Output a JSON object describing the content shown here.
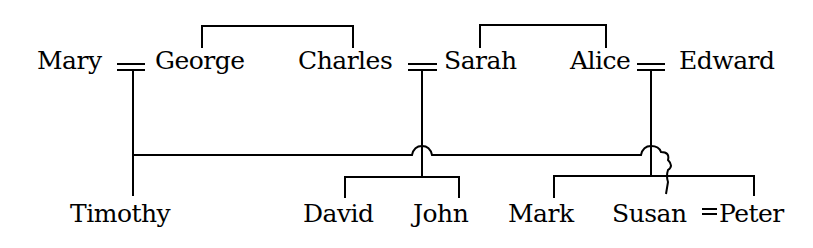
{
  "diagram": {
    "type": "family-tree",
    "ink_color": "#000000",
    "background": "#ffffff",
    "people": {
      "mary": "Mary",
      "george": "George",
      "charles": "Charles",
      "sarah": "Sarah",
      "alice": "Alice",
      "edward": "Edward",
      "timothy": "Timothy",
      "david": "David",
      "john": "John",
      "mark": "Mark",
      "susan": "Susan",
      "peter": "Peter"
    },
    "marriage_symbol": "=",
    "marriages": [
      {
        "spouses": [
          "Mary",
          "George"
        ],
        "children": [
          "Timothy"
        ]
      },
      {
        "spouses": [
          "Charles",
          "Sarah"
        ],
        "children": [
          "David",
          "John"
        ]
      },
      {
        "spouses": [
          "Alice",
          "Edward"
        ],
        "children": [
          "Mark",
          "Peter"
        ]
      },
      {
        "spouses": [
          "Susan",
          "Peter"
        ],
        "children": []
      }
    ],
    "sibling_groups": [
      [
        "George",
        "Charles"
      ],
      [
        "Sarah",
        "Alice"
      ],
      [
        "David",
        "John"
      ],
      [
        "Mark",
        "Peter"
      ]
    ]
  }
}
